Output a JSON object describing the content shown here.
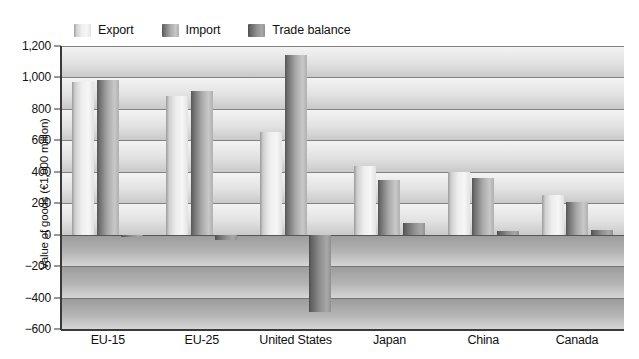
{
  "chart_data": {
    "type": "bar",
    "title": "",
    "subtitle": "",
    "xlabel": "",
    "ylabel": "Value of goods (€1,000 million)",
    "categories": [
      "EU-15",
      "EU-25",
      "United States",
      "Japan",
      "China",
      "Canada"
    ],
    "series": [
      {
        "name": "Export",
        "color": "#e8e8e8",
        "values": [
          970,
          880,
          650,
          435,
          400,
          255
        ]
      },
      {
        "name": "Import",
        "color": "#8a8a8a",
        "values": [
          985,
          915,
          1140,
          350,
          360,
          210
        ]
      },
      {
        "name": "Trade balance",
        "color": "#7d7d7d",
        "values": [
          -15,
          -35,
          -490,
          75,
          25,
          30
        ]
      }
    ],
    "ylim": [
      -600,
      1200
    ],
    "ytick_values": [
      1200,
      1000,
      800,
      600,
      400,
      200,
      0,
      -200,
      -400,
      -600
    ],
    "ytick_labels": [
      "1,200",
      "1,000",
      "800",
      "600",
      "400",
      "200",
      "0",
      "−200",
      "−400",
      "−600"
    ],
    "grid": true,
    "grid_axis": "y",
    "legend_position": "top-left",
    "background": "banded-gradient"
  },
  "legend": {
    "items": [
      {
        "label": "Export",
        "swatch": "legend-swatch-export"
      },
      {
        "label": "Import",
        "swatch": "legend-swatch-import"
      },
      {
        "label": "Trade balance",
        "swatch": "legend-swatch-trade-balance"
      }
    ]
  }
}
